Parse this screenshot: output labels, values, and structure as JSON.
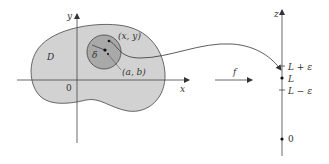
{
  "diagram": {
    "region_label": "D",
    "origin_label": "0",
    "x_axis_label": "x",
    "y_axis_label": "y",
    "point_xy_label": "(x, y)",
    "point_ab_label": "(a, b)",
    "delta_label": "δ",
    "function_label": "f",
    "z_axis_label": "z",
    "z_upper_label": "L + ε",
    "z_limit_label": "L",
    "z_lower_label": "L − ε",
    "z_origin_label": "0"
  },
  "colors": {
    "region_fill": "#d2d2d2",
    "disk_fill": "#a9a9a9",
    "stroke": "#333333"
  }
}
